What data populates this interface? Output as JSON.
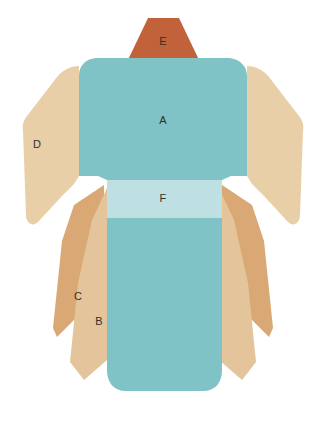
{
  "figure": {
    "background_color": "#ffffff",
    "width": 329,
    "height": 422
  },
  "palette": {
    "body_teal": "#7fc3c6",
    "obi_pale_blue": "#bfe0e2",
    "sleeve_beige": "#e8cfa8",
    "panel_light_tan": "#e3c49b",
    "panel_mid_tan": "#d9a874",
    "collar_rust": "#c1623a",
    "label_text": "#33302c"
  },
  "parts": [
    {
      "id": "A",
      "label": "A",
      "name": "main-body-panel",
      "color": "#7fc3c6",
      "label_x": 163,
      "label_y": 121
    },
    {
      "id": "B",
      "label": "B",
      "name": "lower-light-tan-panel",
      "color": "#e3c49b",
      "label_x": 99,
      "label_y": 322
    },
    {
      "id": "C",
      "label": "C",
      "name": "lower-mid-tan-panel",
      "color": "#d9a874",
      "label_x": 78,
      "label_y": 297
    },
    {
      "id": "D",
      "label": "D",
      "name": "sleeve-panel",
      "color": "#e8cfa8",
      "label_x": 37,
      "label_y": 145
    },
    {
      "id": "E",
      "label": "E",
      "name": "collar-panel",
      "color": "#c1623a",
      "label_x": 163,
      "label_y": 42
    },
    {
      "id": "F",
      "label": "F",
      "name": "obi-sash-band",
      "color": "#bfe0e2",
      "label_x": 163,
      "label_y": 199
    }
  ]
}
